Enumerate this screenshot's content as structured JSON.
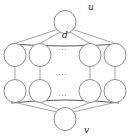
{
  "figure": {
    "colors": {
      "background": "#ffffff",
      "node_stroke": "#8f8f8f",
      "node_fill": "#ffffff",
      "edge_stroke": "#9a9a9a",
      "arc_stroke": "#5a5a5a",
      "label_color": "#2b2b2b",
      "dots_color": "#8a8a8a"
    },
    "labels": {
      "top_node": "u",
      "bottom_node": "v",
      "arc_label": "d"
    },
    "ellipses": {
      "row_top": "...",
      "row_middle": "...",
      "row_bottom": "..."
    },
    "nodes": [
      {
        "id": "u",
        "label": "u",
        "cx": 65,
        "cy": 22,
        "rx": 11,
        "ry": 11.5
      },
      {
        "id": "a1",
        "label": "",
        "cx": 15,
        "cy": 55,
        "rx": 11,
        "ry": 11.5
      },
      {
        "id": "a2",
        "label": "",
        "cx": 40,
        "cy": 55,
        "rx": 11,
        "ry": 11.5
      },
      {
        "id": "a3",
        "label": "",
        "cx": 90,
        "cy": 55,
        "rx": 11,
        "ry": 11.5
      },
      {
        "id": "a4",
        "label": "",
        "cx": 115,
        "cy": 55,
        "rx": 11,
        "ry": 11.5
      },
      {
        "id": "b1",
        "label": "",
        "cx": 15,
        "cy": 91,
        "rx": 11,
        "ry": 11.5
      },
      {
        "id": "b2",
        "label": "",
        "cx": 40,
        "cy": 91,
        "rx": 11,
        "ry": 11.5
      },
      {
        "id": "b3",
        "label": "",
        "cx": 90,
        "cy": 91,
        "rx": 11,
        "ry": 11.5
      },
      {
        "id": "b4",
        "label": "",
        "cx": 115,
        "cy": 91,
        "rx": 11,
        "ry": 11.5
      },
      {
        "id": "v",
        "label": "v",
        "cx": 65,
        "cy": 119,
        "rx": 11,
        "ry": 11.5
      }
    ],
    "edges": [
      {
        "from": "u",
        "to": "a1",
        "kind": "line"
      },
      {
        "from": "u",
        "to": "a2",
        "kind": "line"
      },
      {
        "from": "u",
        "to": "a3",
        "kind": "line"
      },
      {
        "from": "u",
        "to": "a4",
        "kind": "line"
      },
      {
        "from": "a1",
        "to": "b1",
        "kind": "line"
      },
      {
        "from": "a2",
        "to": "b2",
        "kind": "line"
      },
      {
        "from": "a3",
        "to": "b3",
        "kind": "line"
      },
      {
        "from": "a4",
        "to": "b4",
        "kind": "line"
      },
      {
        "from": "b1",
        "to": "v",
        "kind": "line"
      },
      {
        "from": "b2",
        "to": "v",
        "kind": "line"
      },
      {
        "from": "b3",
        "to": "v",
        "kind": "line"
      },
      {
        "from": "b4",
        "to": "v",
        "kind": "line"
      },
      {
        "from": "a1",
        "to": "a4",
        "kind": "arc",
        "label": "d"
      },
      {
        "from": "b1",
        "to": "b4",
        "kind": "arc"
      }
    ],
    "structure_note": "two-terminal series-parallel: u fans out to a row of branch nodes, each branch descends to a second row, then converges at v; ellipses mark omitted repeated branches"
  }
}
